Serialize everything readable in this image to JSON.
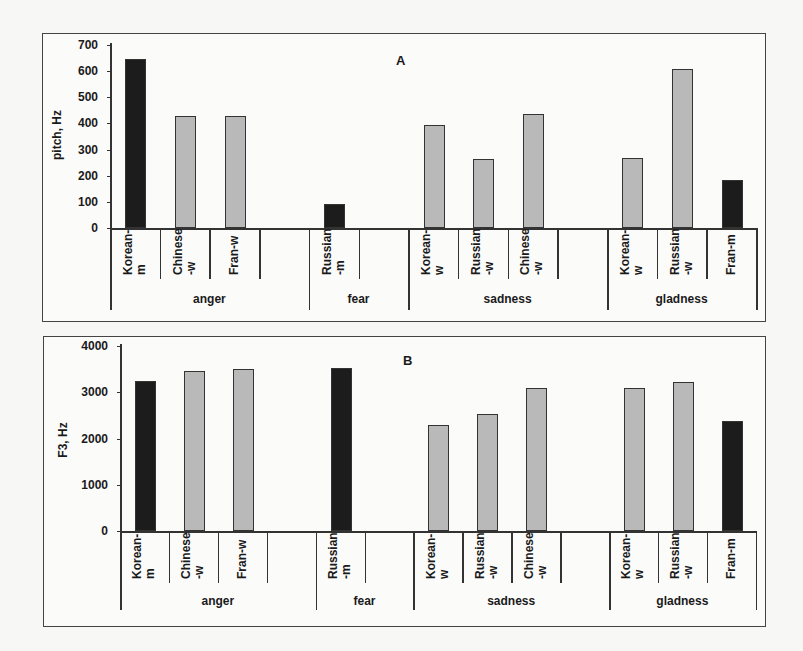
{
  "chart_data": [
    {
      "type": "bar",
      "title": "A",
      "ylabel": "pitch, Hz",
      "ylim": [
        0,
        700
      ],
      "yticks": [
        0,
        100,
        200,
        300,
        400,
        500,
        600,
        700
      ],
      "groups": [
        "anger",
        "fear",
        "sadness",
        "gladness"
      ],
      "slots": [
        {
          "group": "anger",
          "label": "Korean-\nm",
          "value": 645,
          "shade": "dark"
        },
        {
          "group": "anger",
          "label": "Chinese\n-w",
          "value": 430,
          "shade": "light"
        },
        {
          "group": "anger",
          "label": "Fran-w",
          "value": 430,
          "shade": "light"
        },
        {
          "group": "anger",
          "label": "",
          "value": null,
          "shade": ""
        },
        {
          "group": "fear",
          "label": "Russian\n-m",
          "value": 90,
          "shade": "dark"
        },
        {
          "group": "fear",
          "label": "",
          "value": null,
          "shade": ""
        },
        {
          "group": "sadness",
          "label": "Korean-\nw",
          "value": 395,
          "shade": "light"
        },
        {
          "group": "sadness",
          "label": "Russian\n-w",
          "value": 265,
          "shade": "light"
        },
        {
          "group": "sadness",
          "label": "Chinese\n-w",
          "value": 435,
          "shade": "light"
        },
        {
          "group": "sadness",
          "label": "",
          "value": null,
          "shade": ""
        },
        {
          "group": "gladness",
          "label": "Korean-\nw",
          "value": 268,
          "shade": "light"
        },
        {
          "group": "gladness",
          "label": "Russian\n-w",
          "value": 610,
          "shade": "light"
        },
        {
          "group": "gladness",
          "label": "Fran-m",
          "value": 183,
          "shade": "dark"
        }
      ],
      "grid": false,
      "legend": null
    },
    {
      "type": "bar",
      "title": "B",
      "ylabel": "F3, Hz",
      "ylim": [
        0,
        4000
      ],
      "yticks": [
        0,
        1000,
        2000,
        3000,
        4000
      ],
      "groups": [
        "anger",
        "fear",
        "sadness",
        "gladness"
      ],
      "slots": [
        {
          "group": "anger",
          "label": "Korean-\nm",
          "value": 3250,
          "shade": "dark"
        },
        {
          "group": "anger",
          "label": "Chinese\n-w",
          "value": 3450,
          "shade": "light"
        },
        {
          "group": "anger",
          "label": "Fran-w",
          "value": 3500,
          "shade": "light"
        },
        {
          "group": "anger",
          "label": "",
          "value": null,
          "shade": ""
        },
        {
          "group": "fear",
          "label": "Russian\n-m",
          "value": 3530,
          "shade": "dark"
        },
        {
          "group": "fear",
          "label": "",
          "value": null,
          "shade": ""
        },
        {
          "group": "sadness",
          "label": "Korean-\nw",
          "value": 2300,
          "shade": "light"
        },
        {
          "group": "sadness",
          "label": "Russian\n-w",
          "value": 2520,
          "shade": "light"
        },
        {
          "group": "sadness",
          "label": "Chinese\n-w",
          "value": 3100,
          "shade": "light"
        },
        {
          "group": "sadness",
          "label": "",
          "value": null,
          "shade": ""
        },
        {
          "group": "gladness",
          "label": "Korean-\nw",
          "value": 3100,
          "shade": "light"
        },
        {
          "group": "gladness",
          "label": "Russian\n-w",
          "value": 3230,
          "shade": "light"
        },
        {
          "group": "gladness",
          "label": "Fran-m",
          "value": 2370,
          "shade": "dark"
        }
      ],
      "grid": false,
      "legend": null
    }
  ],
  "colors": {
    "dark_bar": "#1c1c1c",
    "light_bar": "#b9b9b9",
    "frame": "#444444"
  }
}
